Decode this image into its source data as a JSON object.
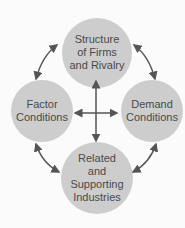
{
  "diagram": {
    "nodes": [
      {
        "id": "top",
        "label": "Structure of Firms and Rivalry",
        "lines": [
          "Structure",
          "of Firms",
          "and Rivalry"
        ]
      },
      {
        "id": "left",
        "label": "Factor Conditions",
        "lines": [
          "Factor",
          "Conditions"
        ]
      },
      {
        "id": "right",
        "label": "Demand Conditions",
        "lines": [
          "Demand",
          "Conditions"
        ]
      },
      {
        "id": "bottom",
        "label": "Related and Supporting Industries",
        "lines": [
          "Related",
          "and",
          "Supporting",
          "Industries"
        ]
      }
    ],
    "edges": [
      {
        "from": "top",
        "to": "left",
        "type": "bidirectional-curved"
      },
      {
        "from": "top",
        "to": "right",
        "type": "bidirectional-curved"
      },
      {
        "from": "left",
        "to": "bottom",
        "type": "bidirectional-curved"
      },
      {
        "from": "right",
        "to": "bottom",
        "type": "bidirectional-curved"
      },
      {
        "from": "top",
        "to": "bottom",
        "type": "bidirectional-straight"
      },
      {
        "from": "left",
        "to": "right",
        "type": "bidirectional-straight"
      }
    ],
    "colors": {
      "circle": "#cdcdcd",
      "arrow": "#555555",
      "text": "#4a4a4a"
    }
  }
}
